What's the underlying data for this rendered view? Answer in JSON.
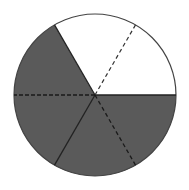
{
  "diagram": {
    "type": "fraction-circle",
    "total_parts": 6,
    "shaded_parts": 4,
    "shade_color": "#5a5a5a",
    "unshaded_color": "#ffffff",
    "outline_color": "#333333",
    "center": [
      95,
      95
    ],
    "radius": 81,
    "shaded_sector_angles_deg": [
      [
        120,
        180
      ],
      [
        180,
        240
      ],
      [
        240,
        300
      ],
      [
        300,
        360
      ]
    ],
    "unshaded_sector_angles_deg": [
      [
        0,
        60
      ],
      [
        60,
        120
      ]
    ],
    "solid_divider_angles_deg": [
      0,
      120,
      240
    ],
    "dashed_divider_angles_deg": [
      60,
      180,
      300
    ]
  }
}
